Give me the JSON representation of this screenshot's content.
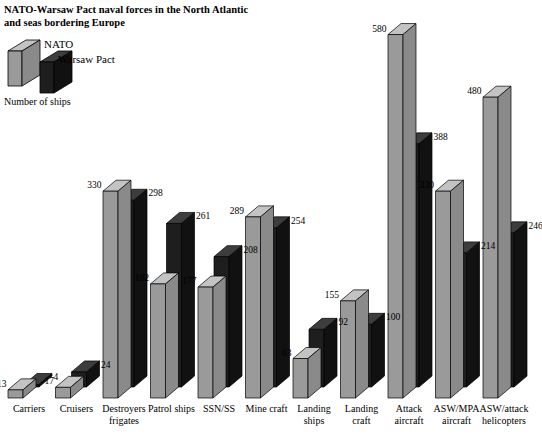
{
  "chart_data": {
    "type": "bar",
    "title": "NATO-Warsaw Pact naval forces in the North Atlantic and seas bordering Europe",
    "title_line1": "NATO-Warsaw Pact naval forces in the North Atlantic",
    "title_line2": "and seas bordering Europe",
    "ylabel": "Number of ships",
    "xlabel": "",
    "grid": false,
    "legend_position": "top-left",
    "ylim": [
      0,
      600
    ],
    "categories": [
      "Carriers",
      "Cruisers",
      "Destroyers frigates",
      "Patrol ships",
      "SSN/SS",
      "Mine craft",
      "Landing ships",
      "Landing craft",
      "Attack aircraft",
      "ASW/MPA aircraft",
      "ASW/attack helicopters"
    ],
    "category_lines": [
      [
        "Carriers"
      ],
      [
        "Cruisers"
      ],
      [
        "Destroyers",
        "frigates"
      ],
      [
        "Patrol ships"
      ],
      [
        "SSN/SS"
      ],
      [
        "Mine craft"
      ],
      [
        "Landing",
        "ships"
      ],
      [
        "Landing",
        "craft"
      ],
      [
        "Attack",
        "aircraft"
      ],
      [
        "ASW/MPA",
        "aircraft"
      ],
      [
        "ASW/attack",
        "helicopters"
      ]
    ],
    "series": [
      {
        "name": "NATO",
        "color": "#9a9a9a",
        "top_color": "#c3c3c3",
        "side_color": "#8a8a8a",
        "values": [
          13,
          17,
          330,
          182,
          177,
          289,
          63,
          155,
          580,
          330,
          480
        ]
      },
      {
        "name": "Warsaw Pact",
        "color": "#1e1e1e",
        "top_color": "#3d3d3d",
        "side_color": "#111111",
        "values": [
          4,
          24,
          298,
          261,
          208,
          254,
          92,
          100,
          388,
          214,
          246
        ]
      }
    ]
  },
  "legend": {
    "nato_label": "NATO",
    "warsaw_label": "Warsaw Pact"
  },
  "colors": {
    "nato": "#9a9a9a",
    "warsaw_pact": "#1e1e1e",
    "background": "#ffffff",
    "text": "#000000",
    "axis": "#000000"
  }
}
